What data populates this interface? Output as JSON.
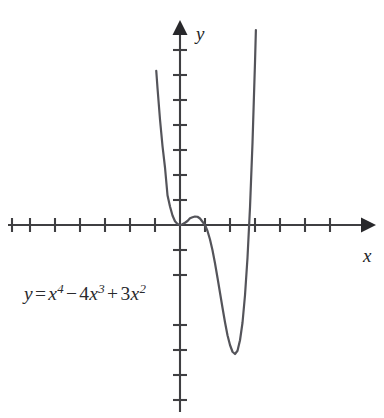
{
  "figure": {
    "equation_label": {
      "lhs": "y",
      "eq_sign": "=",
      "term1_base": "x",
      "term1_exp": "4",
      "minus": "−",
      "term2_coef": "4",
      "term2_base": "x",
      "term2_exp": "3",
      "plus": "+",
      "term3_coef": "3",
      "term3_base": "x",
      "term3_exp": "2",
      "full_text": "y = x4 − 4x3 + 3x2"
    },
    "axes": {
      "x_label": "x",
      "y_label": "y",
      "origin_px": [
        180,
        225
      ],
      "unit_px": 25,
      "x_ticks_left_count": 7,
      "x_ticks_right_count": 6,
      "y_ticks_above_count": 7,
      "y_ticks_below_count": 6,
      "x_axis_start_px": 8,
      "x_axis_end_px": 368,
      "y_axis_top_px": 22,
      "y_axis_bottom_px": 412,
      "tick_half_length_px": 7,
      "gridlines": false,
      "tick_labels_shown": false
    },
    "colors": {
      "background": "#ffffff",
      "axis": "#3f3f42",
      "curve": "#54545a",
      "text": "#2a2a2d",
      "arrow": "#28282b"
    }
  },
  "chart_data": {
    "type": "line",
    "title": "",
    "subtitle": "",
    "xlabel": "x",
    "ylabel": "y",
    "function": "y = x^4 - 4x^3 + 3x^2",
    "annotations": [
      "y = x4 − 4x3 + 3x2"
    ],
    "legend": [],
    "legend_position": "none",
    "grid": false,
    "xlim": [
      -6.9,
      7.5
    ],
    "ylim": [
      -7.5,
      8.1
    ],
    "x_tick_step": 1,
    "y_tick_step": 1,
    "roots": [
      0,
      1,
      3
    ],
    "local_maximum": {
      "x": 0.4,
      "y": 0.345
    },
    "local_minima": [
      {
        "x": 2.28,
        "y": -4.91
      }
    ],
    "inflection_points": [
      {
        "x": 0.88,
        "y": 0.19
      },
      {
        "x": 1.79,
        "y": -3.21
      }
    ],
    "series": [
      {
        "name": "y = x^4 - 4x^3 + 3x^2",
        "x": [
          -0.95,
          -0.9,
          -0.8,
          -0.7,
          -0.6,
          -0.5,
          -0.4,
          -0.3,
          -0.2,
          -0.1,
          0,
          0.1,
          0.2,
          0.3,
          0.4,
          0.5,
          0.6,
          0.7,
          0.8,
          0.9,
          1,
          1.1,
          1.2,
          1.3,
          1.4,
          1.5,
          1.6,
          1.7,
          1.8,
          1.9,
          2,
          2.1,
          2.2,
          2.3,
          2.4,
          2.5,
          2.6,
          2.7,
          2.8,
          2.9,
          3,
          3.05,
          3.1,
          3.15,
          3.2,
          3.25,
          3.3
        ],
        "y": [
          6.17,
          5.48,
          4.22,
          3.16,
          2.3,
          1.19,
          0.74,
          0.38,
          0.15,
          0.04,
          0,
          0.03,
          0.09,
          0.16,
          0.27,
          0.31,
          0.34,
          0.33,
          0.26,
          0.13,
          0,
          -0.24,
          -0.58,
          -1.01,
          -1.53,
          -2.11,
          -2.71,
          -3.31,
          -3.89,
          -4.41,
          -4.8,
          -5.07,
          -5.16,
          -5.03,
          -4.61,
          -3.91,
          -2.81,
          -1.31,
          0.7,
          3.28,
          6.5,
          8.33,
          10.3,
          12.46,
          14.8,
          17.35,
          20.1
        ]
      }
    ]
  }
}
